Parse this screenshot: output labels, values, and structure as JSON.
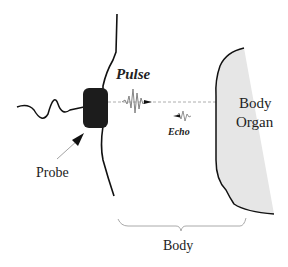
{
  "diagram": {
    "labels": {
      "pulse": "Pulse",
      "echo": "Echo",
      "organ_line1": "Body",
      "organ_line2": "Organ",
      "probe": "Probe",
      "body": "Body"
    },
    "colors": {
      "line": "#111111",
      "probe_fill": "#1c1c1c",
      "organ_fill": "#e6e6e6",
      "beam": "#888888",
      "brace": "#999999",
      "wave": "#777777"
    },
    "icons": {
      "probe": "transducer-probe-icon",
      "pulse": "pulse-wave-icon",
      "echo": "echo-wave-icon",
      "arrow": "pointer-arrow-icon"
    }
  }
}
